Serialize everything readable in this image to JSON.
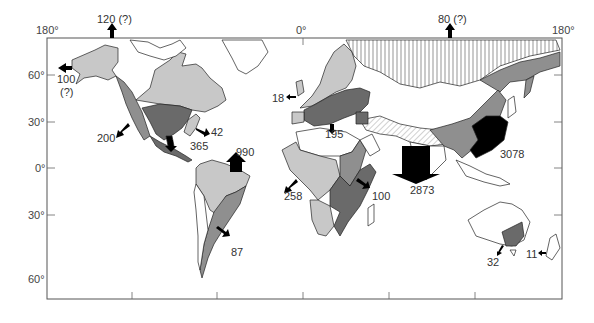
{
  "map": {
    "type": "world-map-with-flow-arrows",
    "frame_color": "#555555",
    "fill_colors": {
      "light": "#c8c8c8",
      "medium": "#8f8f8f",
      "dark": "#6a6a6a",
      "black": "#000000",
      "hatched_vertical": "vertical-lines",
      "hatched_diagonal": "diagonal-lines",
      "white": "#ffffff"
    },
    "axes": {
      "top_longitude_labels": [
        "180°",
        "0°",
        "180°"
      ],
      "left_latitude_labels": [
        "60°",
        "30°",
        "0°",
        "30°",
        "60°"
      ]
    },
    "flows": [
      {
        "id": "alaska-north",
        "label": "120 (?)",
        "direction": "up"
      },
      {
        "id": "siberia-north",
        "label": "80 (?)",
        "direction": "up"
      },
      {
        "id": "alaska-west",
        "label_line1": "100",
        "label_line2": "(?)",
        "direction": "left"
      },
      {
        "id": "western-north-america",
        "label": "200",
        "direction": "down-left"
      },
      {
        "id": "eastern-north-america",
        "label": "42",
        "direction": "down-right"
      },
      {
        "id": "mexico",
        "label": "365",
        "direction": "down"
      },
      {
        "id": "amazon",
        "label": "990",
        "direction": "up"
      },
      {
        "id": "southern-south-america",
        "label": "87",
        "direction": "down-right"
      },
      {
        "id": "western-europe",
        "label": "18",
        "direction": "left"
      },
      {
        "id": "mediterranean",
        "label": "195",
        "direction": "down"
      },
      {
        "id": "west-africa",
        "label": "258",
        "direction": "down-left"
      },
      {
        "id": "east-africa",
        "label": "100",
        "direction": "down-right"
      },
      {
        "id": "south-asia",
        "label": "2873",
        "direction": "down"
      },
      {
        "id": "east-asia",
        "label": "3078",
        "direction": "down"
      },
      {
        "id": "southeast-australia",
        "label": "32",
        "direction": "down-left"
      },
      {
        "id": "new-zealand",
        "label": "11",
        "direction": "left"
      }
    ]
  }
}
